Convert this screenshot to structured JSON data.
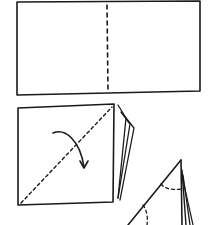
{
  "diagram": {
    "title": "Paper folding steps",
    "stroke_color": "#1a1a1a",
    "background": "#ffffff",
    "steps": [
      {
        "id": 1,
        "label": "Rectangle sheet with vertical center dashed fold line"
      },
      {
        "id": 2,
        "label": "Folded square stack with diagonal dashed fold line and curved arrow"
      },
      {
        "id": 3,
        "label": "Triangle fold with dashed arc guide lines"
      }
    ]
  }
}
